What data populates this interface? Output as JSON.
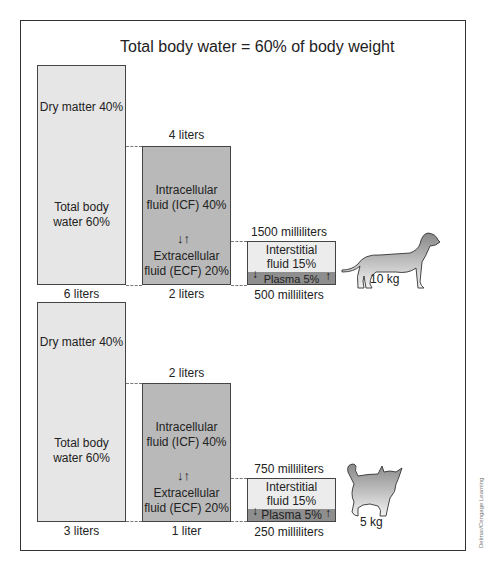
{
  "title": "Total body water = 60% of body weight",
  "credit": "Delmar/Cengage Learning",
  "panels": [
    {
      "animal": "dog",
      "weight": "10 kg",
      "total_box": {
        "dry_label": "Dry matter 40%",
        "water_label": "Total body water 60%",
        "water_line1": "Total body",
        "water_line2": "water 60%",
        "volume": "6 liters"
      },
      "icf_box": {
        "top_volume": "4 liters",
        "icf_line1": "Intracellular",
        "icf_line2": "fluid (ICF) 40%",
        "ecf_line1": "Extracellular",
        "ecf_line2": "fluid (ECF) 20%",
        "bottom_volume": "2 liters"
      },
      "ecf_box": {
        "top_volume": "1500 milliliters",
        "ist_line1": "Interstitial",
        "ist_line2": "fluid 15%",
        "plasma": "Plasma 5%",
        "bottom_volume": "500 milliliters"
      }
    },
    {
      "animal": "cat",
      "weight": "5 kg",
      "total_box": {
        "dry_label": "Dry matter 40%",
        "water_label": "Total body water 60%",
        "water_line1": "Total body",
        "water_line2": "water 60%",
        "volume": "3 liters"
      },
      "icf_box": {
        "top_volume": "2 liters",
        "icf_line1": "Intracellular",
        "icf_line2": "fluid (ICF) 40%",
        "ecf_line1": "Extracellular",
        "ecf_line2": "fluid (ECF) 20%",
        "bottom_volume": "1 liter"
      },
      "ecf_box": {
        "top_volume": "750 milliliters",
        "ist_line1": "Interstitial",
        "ist_line2": "fluid 15%",
        "plasma": "Plasma 5%",
        "bottom_volume": "250 milliliters"
      }
    }
  ],
  "icons": {
    "exchange": "up-down-arrows",
    "down": "↓",
    "up": "↑"
  }
}
